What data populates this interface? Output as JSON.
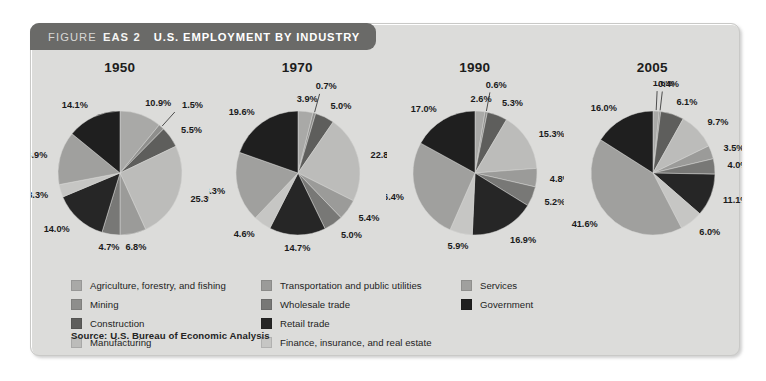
{
  "figure": {
    "header_label": "FIGURE",
    "header_number": "EAS 2",
    "header_title": "U.S. EMPLOYMENT BY INDUSTRY",
    "source": "Source: U.S. Bureau of Economic Analysis",
    "panel_bg": "#dcdcda",
    "header_bg": "#6a6a68"
  },
  "legend": {
    "columns": [
      {
        "items": [
          {
            "label": "Agriculture, forestry, and fishing",
            "color": "#a9a9a7"
          },
          {
            "label": "Mining",
            "color": "#8e8e8c"
          },
          {
            "label": "Construction",
            "color": "#5e5e5c"
          },
          {
            "label": "Manufacturing",
            "color": "#bcbcba"
          }
        ]
      },
      {
        "items": [
          {
            "label": "Transportation and public utilities",
            "color": "#9b9b99"
          },
          {
            "label": "Wholesale trade",
            "color": "#787876"
          },
          {
            "label": "Retail trade",
            "color": "#262626"
          },
          {
            "label": "Finance, insurance, and real estate",
            "color": "#c6c6c4"
          }
        ]
      },
      {
        "items": [
          {
            "label": "Services",
            "color": "#a0a09e"
          },
          {
            "label": "Government",
            "color": "#1f1f1f"
          }
        ]
      }
    ]
  },
  "chart_data": {
    "type": "pie",
    "title": "U.S. EMPLOYMENT BY INDUSTRY",
    "value_unit": "percent",
    "value_suffix": "%",
    "categories": [
      "Agriculture, forestry, and fishing",
      "Mining",
      "Construction",
      "Manufacturing",
      "Transportation and public utilities",
      "Wholesale trade",
      "Retail trade",
      "Finance, insurance, and real estate",
      "Services",
      "Government"
    ],
    "colors": [
      "#a9a9a7",
      "#8e8e8c",
      "#5e5e5c",
      "#bcbcba",
      "#9b9b99",
      "#787876",
      "#262626",
      "#c6c6c4",
      "#a0a09e",
      "#1f1f1f"
    ],
    "series": [
      {
        "name": "1950",
        "labels": [
          "10.9%",
          "1.5%",
          "5.5%",
          "25.3%",
          "6.8%",
          "4.7%",
          "14.0%",
          "3.3%",
          "13.9%",
          "14.1%"
        ],
        "values": [
          10.9,
          1.5,
          5.5,
          25.3,
          6.8,
          4.7,
          14.0,
          3.3,
          13.9,
          14.1
        ]
      },
      {
        "name": "1970",
        "labels": [
          "3.9%",
          "0.7%",
          "5.0%",
          "22.8%",
          "5.4%",
          "5.0%",
          "14.7%",
          "4.6%",
          "18.3%",
          "19.6%"
        ],
        "values": [
          3.9,
          0.7,
          5.0,
          22.8,
          5.4,
          5.0,
          14.7,
          4.6,
          18.3,
          19.6
        ]
      },
      {
        "name": "1990",
        "labels": [
          "2.6%",
          "0.6%",
          "5.3%",
          "15.3%",
          "4.8%",
          "5.2%",
          "16.9%",
          "5.9%",
          "26.4%",
          "17.0%"
        ],
        "values": [
          2.6,
          0.6,
          5.3,
          15.3,
          4.8,
          5.2,
          16.9,
          5.9,
          26.4,
          17.0
        ]
      },
      {
        "name": "2005",
        "labels": [
          "1.6%",
          "0.4%",
          "6.1%",
          "9.7%",
          "3.5%",
          "4.0%",
          "11.1%",
          "6.0%",
          "41.6%",
          "16.0%"
        ],
        "values": [
          1.6,
          0.4,
          6.1,
          9.7,
          3.5,
          4.0,
          11.1,
          6.0,
          41.6,
          16.0
        ]
      }
    ],
    "legend_position": "below",
    "grid": false
  }
}
